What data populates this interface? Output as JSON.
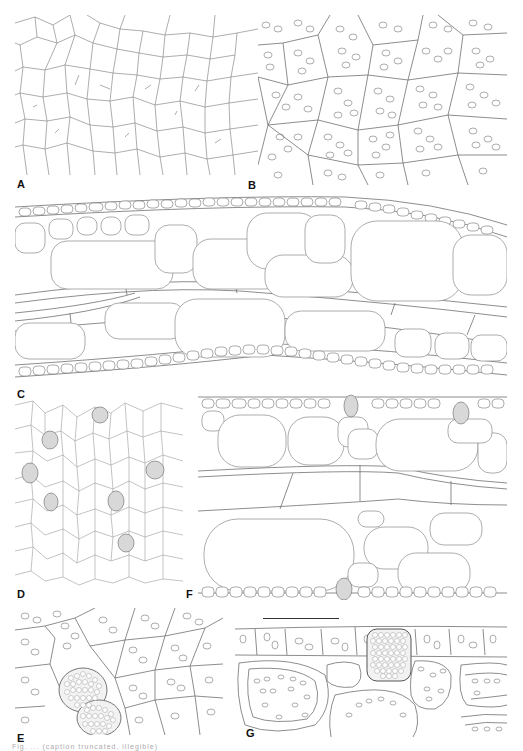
{
  "figure": {
    "type": "botanical anatomy line drawings",
    "panels": [
      {
        "id": "A",
        "label": "A",
        "description": "epidermis surface view, polygonal cells",
        "box": [
          15,
          15,
          243,
          175
        ],
        "label_pos": [
          17,
          179
        ]
      },
      {
        "id": "B",
        "label": "B",
        "description": "surface view, cells with chloroplasts",
        "box": [
          258,
          15,
          249,
          170
        ],
        "label_pos": [
          248,
          180
        ]
      },
      {
        "id": "C",
        "label": "C",
        "description": "transverse section, lamina with large parenchyma cells",
        "box": [
          15,
          195,
          492,
          190
        ],
        "label_pos": [
          17,
          389
        ]
      },
      {
        "id": "D",
        "label": "D",
        "description": "surface view with stippled idioblasts",
        "box": [
          15,
          395,
          168,
          193
        ],
        "label_pos": [
          17,
          589
        ]
      },
      {
        "id": "E",
        "label": "E",
        "description": "surface view with raphide idioblasts",
        "box": [
          15,
          608,
          208,
          127
        ],
        "label_pos": [
          17,
          733
        ]
      },
      {
        "id": "F",
        "label": "F",
        "description": "transverse section with idioblasts",
        "box": [
          198,
          393,
          309,
          207
        ],
        "label_pos": [
          186,
          589
        ]
      },
      {
        "id": "G",
        "label": "G",
        "description": "transverse section with raphide idioblast",
        "box": [
          235,
          625,
          272,
          112
        ],
        "label_pos": [
          246,
          728
        ]
      }
    ],
    "scale_bar": {
      "x": 263,
      "y": 618,
      "length": 76
    },
    "caption": "Fig. ... (caption truncated, illegible)"
  },
  "labels": {
    "A": "A",
    "B": "B",
    "C": "C",
    "D": "D",
    "E": "E",
    "F": "F",
    "G": "G"
  },
  "colors": {
    "line": "#8a8a8a",
    "stipple": "#d8d8d8",
    "label": "#111111",
    "background": "#ffffff"
  }
}
